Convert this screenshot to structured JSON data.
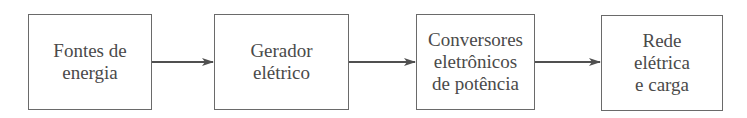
{
  "diagram": {
    "type": "block-flow",
    "direction": "left-to-right",
    "blocks": [
      {
        "id": "sources",
        "lines": [
          "Fontes de",
          "energia"
        ]
      },
      {
        "id": "generator",
        "lines": [
          "Gerador",
          "elétrico"
        ]
      },
      {
        "id": "converters",
        "lines": [
          "Conversores",
          "eletrônicos",
          "de potência"
        ]
      },
      {
        "id": "grid",
        "lines": [
          "Rede",
          "elétrica",
          "e carga"
        ]
      }
    ],
    "edges": [
      {
        "from": "sources",
        "to": "generator"
      },
      {
        "from": "generator",
        "to": "converters"
      },
      {
        "from": "converters",
        "to": "grid"
      }
    ],
    "colors": {
      "line": "#6a6a6a",
      "text": "#4a4a4a",
      "arrow": "#505050"
    }
  }
}
